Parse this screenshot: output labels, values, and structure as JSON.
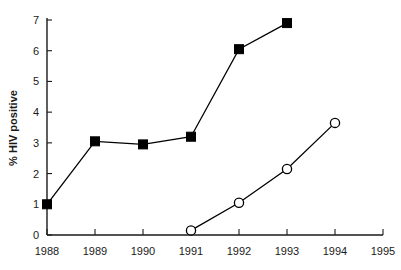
{
  "chart_data": {
    "type": "line",
    "title": "",
    "subtitle": "",
    "xlabel": "",
    "ylabel": "% HIV positive",
    "x": [
      1988,
      1989,
      1990,
      1991,
      1992,
      1993,
      1994,
      1995
    ],
    "xtick_labels": [
      "1988",
      "1989",
      "1990",
      "1991",
      "1992",
      "1993",
      "1994",
      "1995"
    ],
    "ytick_labels": [
      "0",
      "1",
      "2",
      "3",
      "4",
      "5",
      "6",
      "7"
    ],
    "yticks": [
      0,
      1,
      2,
      3,
      4,
      5,
      6,
      7
    ],
    "xlim": [
      1988,
      1995
    ],
    "ylim": [
      0,
      7
    ],
    "grid": false,
    "legend": false,
    "legend_position": "none",
    "series": [
      {
        "name": "filled-square-series",
        "marker": "filled-square",
        "color": "#000000",
        "x": [
          1988,
          1989,
          1990,
          1991,
          1992,
          1993
        ],
        "values": [
          1.0,
          3.05,
          2.95,
          3.2,
          6.05,
          6.9
        ]
      },
      {
        "name": "open-circle-series",
        "marker": "open-circle",
        "color": "#000000",
        "x": [
          1991,
          1992,
          1993,
          1994
        ],
        "values": [
          0.15,
          1.05,
          2.15,
          3.65
        ]
      }
    ]
  },
  "colors": {
    "background": "#ffffff",
    "axis": "#1a1a1a",
    "line": "#000000",
    "marker_fill_filled": "#000000",
    "marker_fill_open": "#ffffff"
  }
}
